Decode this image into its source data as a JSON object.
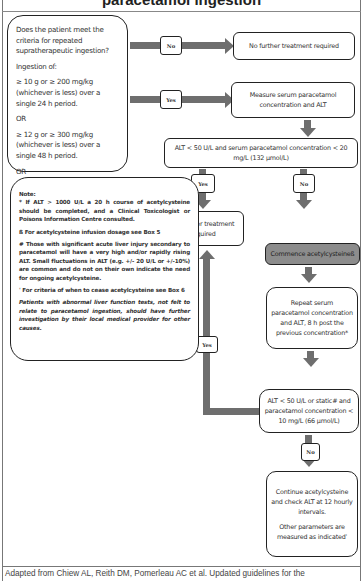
{
  "title": "paracetamol ingestion",
  "criteria_box": {
    "question": "Does the patient meet the criteria for repeated supratherapeutic ingestion?",
    "ingestion_label": "Ingestion of:",
    "option1": "≥ 10 g or ≥ 200 mg/kg (whichever is less) over a single 24 h period.",
    "or1": "OR",
    "option2": "≥ 12 g or ≥ 300 mg/kg (whichever is less) over a single 48 h period.",
    "or2": "OR",
    "option3": "≥ a daily therapeutic dose^ per day for more than 48 h in those who also have abdominal pain or nausea or vomiting.",
    "note": "Note: ^ Therapeutic daily dose of paracetamol in adults is a total dose of 60 mg/kg over 24 h and up to a maximum dose of 4 g/day. For paediatric dosage refer to local guidelines."
  },
  "flow": {
    "no_label": "No",
    "yes_label": "Yes",
    "no_further_1": "No further treatment required",
    "measure": "Measure serum paracetamol concentration and ALT",
    "alt_check_1": "ALT < 50 U/L and serum paracetamol concentration < 20 mg/L (132 µmol/L)",
    "no_further_2": "No further treatment required",
    "commence": "Commence acetylcysteineß",
    "repeat": "Repeat serum paracetamol concentration and ALT, 8 h post the previous concentration*",
    "alt_check_2": "ALT < 50 U/L or static# and paracetamol concentration < 10 mg/L (66 µmol/L)",
    "continue": "Continue acetylcysteine and check ALT at 12 hourly intervals.",
    "other_params": "Other parameters are measured as indicatedˈ"
  },
  "notes_box": {
    "heading": "Note:",
    "n1": "* If ALT > 1000 U/L a 20 h course of acetylcysteine should be completed, and a Clinical Toxicologist or Poisons Information Centre consulted.",
    "n2": "ß For acetylcysteine infusion dosage see Box 5",
    "n3": "# Those with significant acute liver injury secondary to paracetamol will have a very high and/or rapidly rising ALT. Small fluctuations in ALT (e.g. +/- 20 U/L or +/-10%) are common and do not on their own indicate the need for ongoing acetylcysteine.",
    "n4": "ˈ For criteria of when to cease acetylcysteine see Box 6",
    "n5": "Patients with abnormal liver function tests, not felt to relate to paracetamol ingestion, should have further investigation by their local medical provider for other causes."
  },
  "footer": "Adapted from Chiew AL, Reith DM, Pomerleau AC et al. Updated guidelines for the",
  "colors": {
    "arrow": "#6e6e6e",
    "highlight_box": "#8c8c8c",
    "border": "#222222"
  }
}
